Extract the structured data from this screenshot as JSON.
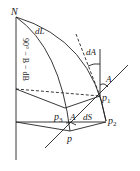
{
  "diagram": {
    "labels": {
      "north_pole": "N",
      "dL": "dL",
      "colatitude": "90° − B − dB",
      "dA": "dA",
      "azimuth_p1": "A",
      "p1": "p",
      "p1_sub": "1",
      "p2": "p",
      "p2_sub": "2",
      "p3": "p",
      "p3_sub": "3",
      "azimuth_p3": "A",
      "dS": "dS",
      "p": "p"
    },
    "colors": {
      "stroke": "#222222",
      "background": "#ffffff"
    }
  }
}
